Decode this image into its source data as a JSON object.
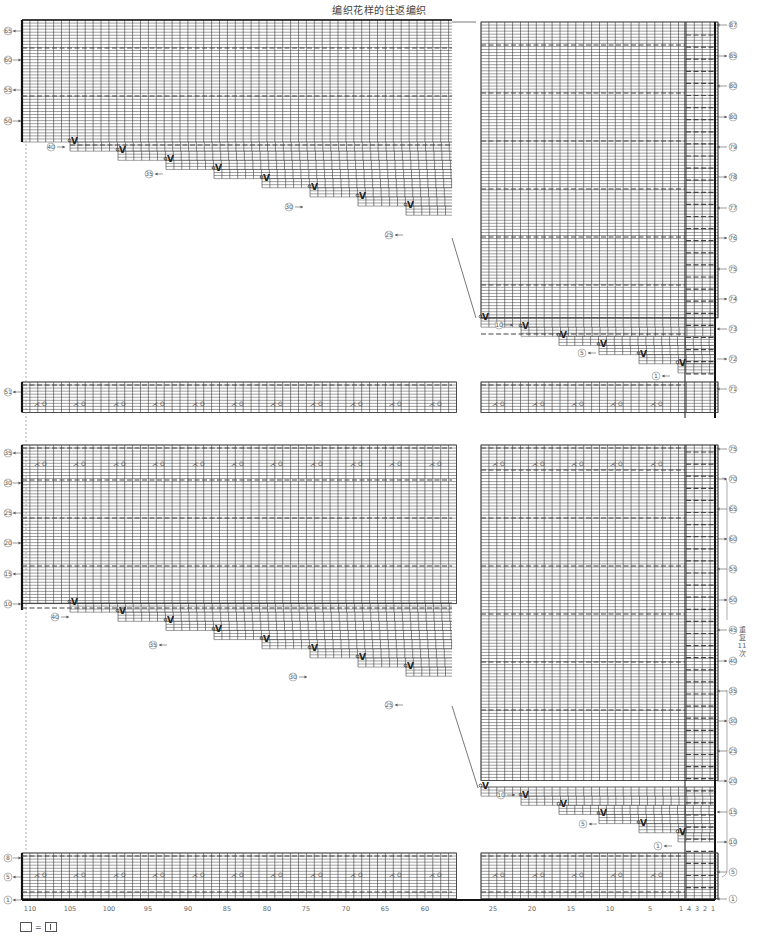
{
  "title": "编织花样的往返编织",
  "repeat_note": "重复11次",
  "legend": {
    "equals": "="
  },
  "bottom_axis": {
    "left_ticks": [
      {
        "label": "110",
        "x": 30
      },
      {
        "label": "105",
        "x": 70
      },
      {
        "label": "100",
        "x": 109
      },
      {
        "label": "95",
        "x": 148
      },
      {
        "label": "90",
        "x": 188
      },
      {
        "label": "85",
        "x": 227
      },
      {
        "label": "80",
        "x": 267
      },
      {
        "label": "75",
        "x": 306
      },
      {
        "label": "70",
        "x": 346
      },
      {
        "label": "65",
        "x": 385
      },
      {
        "label": "60",
        "x": 425
      }
    ],
    "right_ticks": [
      {
        "label": "25",
        "x": 493
      },
      {
        "label": "20",
        "x": 532
      },
      {
        "label": "15",
        "x": 571
      },
      {
        "label": "10",
        "x": 610
      },
      {
        "label": "5",
        "x": 650
      },
      {
        "label": "1",
        "x": 681
      },
      {
        "label": "4",
        "x": 689
      },
      {
        "label": "3",
        "x": 697
      },
      {
        "label": "2",
        "x": 705
      },
      {
        "label": "1",
        "x": 713
      }
    ]
  },
  "left_row_labels": [
    {
      "text": "65",
      "y": 31,
      "dir": "out"
    },
    {
      "text": "60",
      "y": 60,
      "dir": "in"
    },
    {
      "text": "55",
      "y": 90,
      "dir": "out"
    },
    {
      "text": "50",
      "y": 121,
      "dir": "in"
    },
    {
      "text": "51",
      "y": 392,
      "dir": "out"
    },
    {
      "text": "35",
      "y": 453,
      "dir": "out"
    },
    {
      "text": "30",
      "y": 483,
      "dir": "in"
    },
    {
      "text": "25",
      "y": 513,
      "dir": "out"
    },
    {
      "text": "20",
      "y": 543,
      "dir": "in"
    },
    {
      "text": "15",
      "y": 574,
      "dir": "out"
    },
    {
      "text": "10",
      "y": 604,
      "dir": "in"
    },
    {
      "text": "8",
      "y": 858,
      "dir": "in"
    },
    {
      "text": "5",
      "y": 877,
      "dir": "out"
    },
    {
      "text": "1",
      "y": 900,
      "dir": "out"
    }
  ],
  "right_row_labels": [
    {
      "text": "87",
      "y": 25,
      "dir": "in"
    },
    {
      "text": "85",
      "y": 56,
      "dir": "out"
    },
    {
      "text": "80",
      "y": 86,
      "dir": "in"
    },
    {
      "text": "80",
      "y": 117,
      "dir": "out"
    },
    {
      "text": "79",
      "y": 147,
      "dir": "in"
    },
    {
      "text": "78",
      "y": 177,
      "dir": "out"
    },
    {
      "text": "77",
      "y": 208,
      "dir": "in"
    },
    {
      "text": "76",
      "y": 238,
      "dir": "out"
    },
    {
      "text": "75",
      "y": 269,
      "dir": "in"
    },
    {
      "text": "74",
      "y": 299,
      "dir": "out"
    },
    {
      "text": "73",
      "y": 329,
      "dir": "in"
    },
    {
      "text": "72",
      "y": 359,
      "dir": "out"
    },
    {
      "text": "71",
      "y": 389,
      "dir": "in"
    },
    {
      "text": "75",
      "y": 449,
      "dir": "in"
    },
    {
      "text": "70",
      "y": 479,
      "dir": "out"
    },
    {
      "text": "65",
      "y": 509,
      "dir": "in"
    },
    {
      "text": "60",
      "y": 539,
      "dir": "out"
    },
    {
      "text": "55",
      "y": 569,
      "dir": "in"
    },
    {
      "text": "50",
      "y": 600,
      "dir": "out"
    },
    {
      "text": "45",
      "y": 630,
      "dir": "in"
    },
    {
      "text": "40",
      "y": 661,
      "dir": "out"
    },
    {
      "text": "35",
      "y": 691,
      "dir": "in"
    },
    {
      "text": "30",
      "y": 721,
      "dir": "out"
    },
    {
      "text": "25",
      "y": 751,
      "dir": "in"
    },
    {
      "text": "20",
      "y": 781,
      "dir": "out"
    },
    {
      "text": "15",
      "y": 812,
      "dir": "in"
    },
    {
      "text": "10",
      "y": 842,
      "dir": "out"
    },
    {
      "text": "5",
      "y": 872,
      "dir": "in"
    },
    {
      "text": "1",
      "y": 899,
      "dir": "in"
    }
  ],
  "step_labels_left_upper": [
    {
      "text": "40",
      "x": 51,
      "y": 147,
      "dir": "right"
    },
    {
      "text": "35",
      "x": 149,
      "y": 174,
      "dir": "left"
    },
    {
      "text": "30",
      "x": 289,
      "y": 207,
      "dir": "right"
    },
    {
      "text": "25",
      "x": 389,
      "y": 235,
      "dir": "left"
    }
  ],
  "step_labels_left_lower": [
    {
      "text": "40",
      "x": 55,
      "y": 617,
      "dir": "right"
    },
    {
      "text": "35",
      "x": 153,
      "y": 645,
      "dir": "left"
    },
    {
      "text": "30",
      "x": 293,
      "y": 677,
      "dir": "right"
    },
    {
      "text": "25",
      "x": 389,
      "y": 705,
      "dir": "left"
    }
  ],
  "step_labels_right_upper": [
    {
      "text": "10",
      "x": 499,
      "y": 325,
      "dir": "right"
    },
    {
      "text": "5",
      "x": 582,
      "y": 353,
      "dir": "left"
    },
    {
      "text": "1",
      "x": 656,
      "y": 376,
      "dir": "left"
    }
  ],
  "step_labels_right_lower": [
    {
      "text": "10",
      "x": 501,
      "y": 795,
      "dir": "right"
    },
    {
      "text": "5",
      "x": 583,
      "y": 824,
      "dir": "left"
    },
    {
      "text": "1",
      "x": 658,
      "y": 846,
      "dir": "left"
    }
  ],
  "symbols": {
    "decrease_yo": "⋌ O",
    "slip": "V"
  },
  "colors": {
    "grid": "#3a3a3a",
    "text": "#555555",
    "dash": "#444444",
    "heavy": "#111111"
  }
}
